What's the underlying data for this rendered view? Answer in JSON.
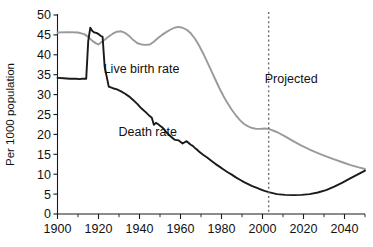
{
  "chart_data": {
    "type": "line",
    "title": "",
    "xlabel": "",
    "ylabel": "Per 1000 population",
    "xlim": [
      1900,
      2050
    ],
    "ylim": [
      0,
      50
    ],
    "grid": false,
    "legend_position": "inline-annotations",
    "x_ticks": [
      1900,
      1920,
      1940,
      1960,
      1980,
      2000,
      2020,
      2040
    ],
    "x_tick_labels": [
      "1900",
      "1920",
      "1940",
      "1960",
      "1980",
      "2000",
      "2020",
      "2040"
    ],
    "x_minor_step": 10,
    "y_ticks": [
      0,
      5,
      10,
      15,
      20,
      25,
      30,
      35,
      40,
      45,
      50
    ],
    "y_tick_labels": [
      "0",
      "5",
      "10",
      "15",
      "20",
      "25",
      "30",
      "35",
      "40",
      "45",
      "50"
    ],
    "annotations": [
      {
        "name": "live-birth-rate-label",
        "text": "Live birth rate",
        "x": 1941,
        "y": 35.5
      },
      {
        "name": "death-rate-label",
        "text": "Death rate",
        "x": 1944,
        "y": 19.5
      },
      {
        "name": "projected-label",
        "text": "Projected",
        "x": 2014,
        "y": 33.0
      }
    ],
    "projection_marker": {
      "name": "projection-divider",
      "text": "",
      "x": 2003,
      "style": "dotted-vertical",
      "color": "#6e6e6e"
    },
    "series": [
      {
        "name": "Live birth rate",
        "color": "#9a9a9a",
        "width": 1.9,
        "x": [
          1900,
          1905,
          1910,
          1913,
          1915,
          1917,
          1919,
          1920,
          1921,
          1923,
          1925,
          1927,
          1929,
          1931,
          1933,
          1935,
          1937,
          1939,
          1941,
          1943,
          1945,
          1947,
          1949,
          1951,
          1953,
          1955,
          1957,
          1959,
          1961,
          1963,
          1965,
          1967,
          1969,
          1971,
          1973,
          1975,
          1977,
          1979,
          1981,
          1983,
          1985,
          1987,
          1989,
          1991,
          1993,
          1995,
          1997,
          1999,
          2001,
          2003,
          2007,
          2011,
          2015,
          2019,
          2023,
          2027,
          2031,
          2035,
          2039,
          2043,
          2047,
          2050
        ],
        "y": [
          45.6,
          45.7,
          45.6,
          45.2,
          44.5,
          43.5,
          42.8,
          42.6,
          43.0,
          43.8,
          44.6,
          45.3,
          45.8,
          45.9,
          45.5,
          44.7,
          43.7,
          42.9,
          42.6,
          42.5,
          42.6,
          43.3,
          44.2,
          45.0,
          45.7,
          46.3,
          46.8,
          47.0,
          46.8,
          46.3,
          45.4,
          44.1,
          42.4,
          40.4,
          38.2,
          36.0,
          33.8,
          31.6,
          29.6,
          27.8,
          26.2,
          24.8,
          23.6,
          22.6,
          22.0,
          21.6,
          21.4,
          21.4,
          21.5,
          21.4,
          20.6,
          19.5,
          18.3,
          17.2,
          16.2,
          15.3,
          14.5,
          13.7,
          13.0,
          12.3,
          11.7,
          11.3
        ]
      },
      {
        "name": "Death rate",
        "color": "#1a1a1a",
        "width": 1.9,
        "x": [
          1900,
          1903,
          1906,
          1909,
          1911,
          1912,
          1913,
          1914,
          1915,
          1916,
          1917,
          1918,
          1919,
          1920,
          1921,
          1922,
          1923,
          1925,
          1927,
          1929,
          1931,
          1933,
          1935,
          1937,
          1939,
          1941,
          1943,
          1945,
          1946,
          1947,
          1948,
          1949,
          1950,
          1951,
          1952,
          1953,
          1955,
          1957,
          1959,
          1961,
          1963,
          1965,
          1966,
          1967,
          1968,
          1969,
          1971,
          1973,
          1975,
          1977,
          1979,
          1981,
          1983,
          1985,
          1987,
          1989,
          1991,
          1993,
          1995,
          1997,
          1999,
          2001,
          2003,
          2007,
          2011,
          2015,
          2019,
          2023,
          2027,
          2031,
          2035,
          2039,
          2043,
          2047,
          2050
        ],
        "y": [
          34.2,
          34.1,
          34.0,
          34.0,
          33.9,
          34.0,
          34.0,
          34.0,
          43.5,
          46.8,
          46.0,
          45.6,
          45.5,
          45.2,
          44.8,
          44.5,
          37.0,
          32.0,
          31.6,
          31.3,
          30.8,
          30.2,
          29.5,
          28.6,
          27.6,
          26.5,
          25.6,
          24.6,
          24.2,
          22.4,
          22.9,
          22.6,
          22.2,
          21.8,
          21.3,
          20.6,
          19.6,
          18.7,
          18.5,
          17.7,
          18.3,
          17.4,
          17.1,
          16.6,
          16.2,
          15.7,
          14.9,
          14.2,
          13.4,
          12.6,
          11.9,
          11.2,
          10.5,
          9.9,
          9.2,
          8.6,
          8.0,
          7.5,
          7.0,
          6.6,
          6.2,
          5.8,
          5.5,
          5.0,
          4.8,
          4.75,
          4.8,
          5.0,
          5.4,
          6.0,
          6.9,
          7.9,
          9.0,
          10.1,
          10.9
        ]
      }
    ]
  }
}
